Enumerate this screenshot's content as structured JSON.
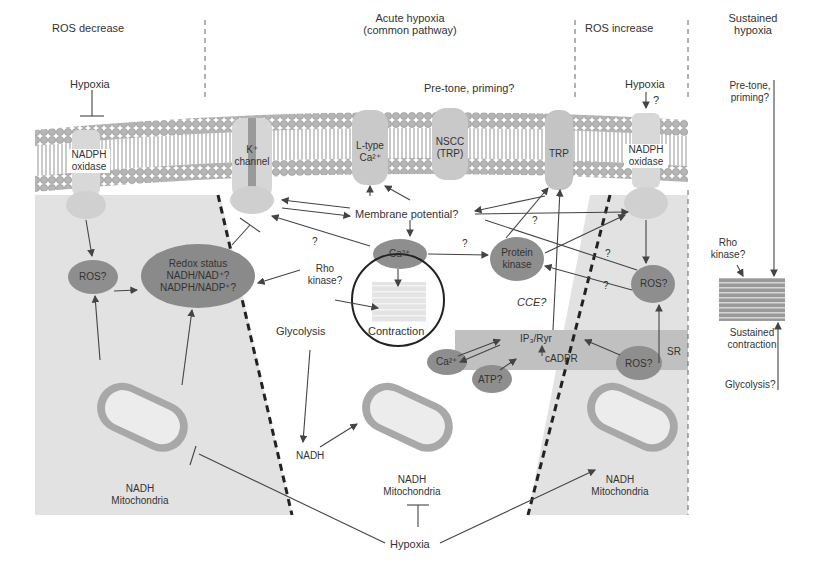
{
  "sections": {
    "ros_decrease": "ROS decrease",
    "acute_hypoxia_1": "Acute hypoxia",
    "acute_hypoxia_2": "(common pathway)",
    "ros_increase": "ROS increase",
    "sustained_1": "Sustained",
    "sustained_2": "hypoxia"
  },
  "top": {
    "hypoxia_left": "Hypoxia",
    "pretone_center": "Pre-tone, priming?",
    "hypoxia_right": "Hypoxia",
    "hypoxia_right_q": "?",
    "pretone_right_1": "Pre-tone,",
    "pretone_right_2": "priming?"
  },
  "channels": {
    "nadph_left_1": "NADPH",
    "nadph_left_2": "oxidase",
    "k_channel_1": "K⁺",
    "k_channel_2": "channel",
    "ltype_1": "L-type",
    "ltype_2": "Ca²⁺",
    "nscc_1": "NSCC",
    "nscc_2": "(TRP)",
    "trp": "TRP",
    "nadph_right_1": "NADPH",
    "nadph_right_2": "oxidase"
  },
  "nodes": {
    "membrane_potential": "Membrane potential?",
    "ros_left": "ROS?",
    "redox_1": "Redox status",
    "redox_2": "NADH/NAD⁺?",
    "redox_3": "NADPH/NADP⁺?",
    "ca": "Ca²⁺",
    "protein_kinase_1": "Protein",
    "protein_kinase_2": "kinase",
    "ros_right": "ROS?",
    "rho_kinase_1": "Rho",
    "rho_kinase_2": "kinase?",
    "contraction": "Contraction",
    "glycolysis": "Glycolysis",
    "cce": "CCE?",
    "ip3_ryr": "IP₃/Ryr",
    "cadpr": "cADPR",
    "ca_sr": "Ca²⁺",
    "atp": "ATP?",
    "ros_sr": "ROS?",
    "sr": "SR",
    "nadh": "NADH",
    "q1": "?",
    "q2": "?",
    "q3": "?",
    "q4": "?",
    "q5": "?"
  },
  "mitochondria": {
    "left_1": "NADH",
    "left_2": "Mitochondria",
    "center_1": "NADH",
    "center_2": "Mitochondria",
    "right_1": "NADH",
    "right_2": "Mitochondria"
  },
  "bottom": {
    "hypoxia": "Hypoxia"
  },
  "sustained": {
    "rho_1": "Rho",
    "rho_2": "kinase?",
    "contraction_1": "Sustained",
    "contraction_2": "contraction",
    "glycolysis": "Glycolysis?"
  },
  "colors": {
    "membrane_head": "#b8b8b8",
    "protein": "#d0d0d0",
    "node_dark": "#8a8a8a",
    "shaded_region": "#e0e0e0",
    "sr_band": "#bdbdbd"
  }
}
